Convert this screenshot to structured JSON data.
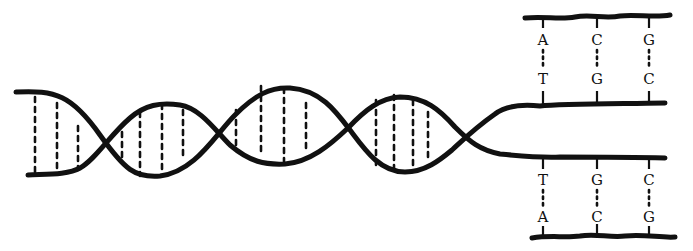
{
  "diagram": {
    "type": "dna-double-helix-replication",
    "colors": {
      "ink": "#111111",
      "background": "#ffffff"
    },
    "upper_daughter": {
      "pairs": [
        {
          "top": "A",
          "bottom": "T"
        },
        {
          "top": "C",
          "bottom": "G"
        },
        {
          "top": "G",
          "bottom": "C"
        }
      ]
    },
    "lower_daughter": {
      "pairs": [
        {
          "top": "T",
          "bottom": "A"
        },
        {
          "top": "G",
          "bottom": "C"
        },
        {
          "top": "C",
          "bottom": "G"
        }
      ]
    }
  }
}
